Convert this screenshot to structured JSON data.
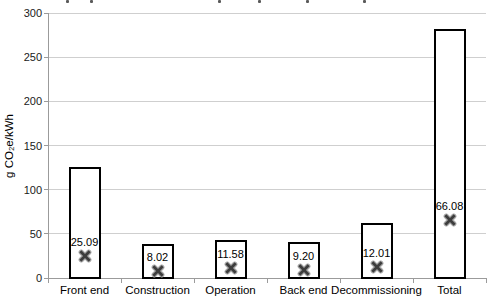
{
  "figure": {
    "y_axis_title": "g CO₂e/kWh"
  },
  "chart_data": {
    "type": "bar",
    "subtype": "range-boxes-with-mean-x-markers",
    "title": "",
    "xlabel": "",
    "ylabel": "g CO₂e/kWh",
    "categories": [
      "Front end",
      "Construction",
      "Operation",
      "Back end",
      "Decommissioning",
      "Total"
    ],
    "series": [
      {
        "name": "mean",
        "marker": "x",
        "values": [
          25.09,
          8.02,
          11.58,
          9.2,
          12.01,
          66.08
        ],
        "labels": [
          "25.09",
          "8.02",
          "11.58",
          "9.20",
          "12.01",
          "66.08"
        ]
      },
      {
        "name": "range_min",
        "values": [
          0,
          0,
          0,
          0,
          0,
          0
        ]
      },
      {
        "name": "range_max_estimated",
        "values": [
          126,
          38,
          43,
          41,
          62,
          282
        ]
      }
    ],
    "ylim": [
      0,
      300
    ],
    "yticks": [
      0,
      50,
      100,
      150,
      200,
      250,
      300
    ],
    "ytick_labels": [
      "0",
      "50",
      "100",
      "150",
      "200",
      "250",
      "300"
    ],
    "grid": true,
    "legend": "none",
    "colors": {
      "bar_fill": "#ffffff",
      "bar_border": "#000000",
      "marker_core": "#3d3d3d",
      "marker_halo": "#aaaaaa",
      "gridline": "#cfcfcf",
      "axis": "#9b9b9b",
      "text": "#000000"
    }
  },
  "cropped_title_fragments": {
    "description": "bottom remnants of a cut-off title line at top edge",
    "positions_x": [
      66,
      90,
      218,
      258,
      306,
      363
    ]
  }
}
